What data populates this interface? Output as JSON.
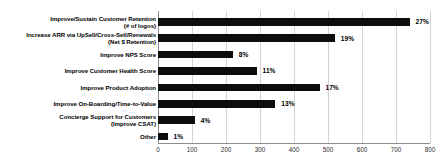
{
  "chart_data": {
    "type": "bar",
    "orientation": "horizontal",
    "title": "",
    "xlabel": "",
    "ylabel": "",
    "xlim": [
      0,
      800
    ],
    "xticks": [
      0,
      100,
      200,
      300,
      400,
      500,
      600,
      700,
      800
    ],
    "grid": true,
    "legend": false,
    "bar_color": "#0d0d0d",
    "gridline_color": "#d4d4d4",
    "axis_color": "#8d8d8d",
    "categories": [
      "Improve/Sustain Customer Retention\n(# of logos)",
      "Increase ARR via UpSell/Cross-Sell/Renewals\n(Net $ Retention)",
      "Improve NPS Score",
      "Improve Customer Health Score",
      "Improve Product Adoption",
      "Improve On-Boarding/Time-to-Value",
      "Concierge Support for Customers\n(Improve CSAT)",
      "Other"
    ],
    "values": [
      740,
      520,
      220,
      290,
      475,
      345,
      108,
      28
    ],
    "data_labels": [
      "27%",
      "19%",
      "8%",
      "11%",
      "17%",
      "13%",
      "4%",
      "1%"
    ],
    "tick_labels": [
      "0",
      "100",
      "200",
      "300",
      "400",
      "500",
      "600",
      "700",
      "800"
    ]
  }
}
